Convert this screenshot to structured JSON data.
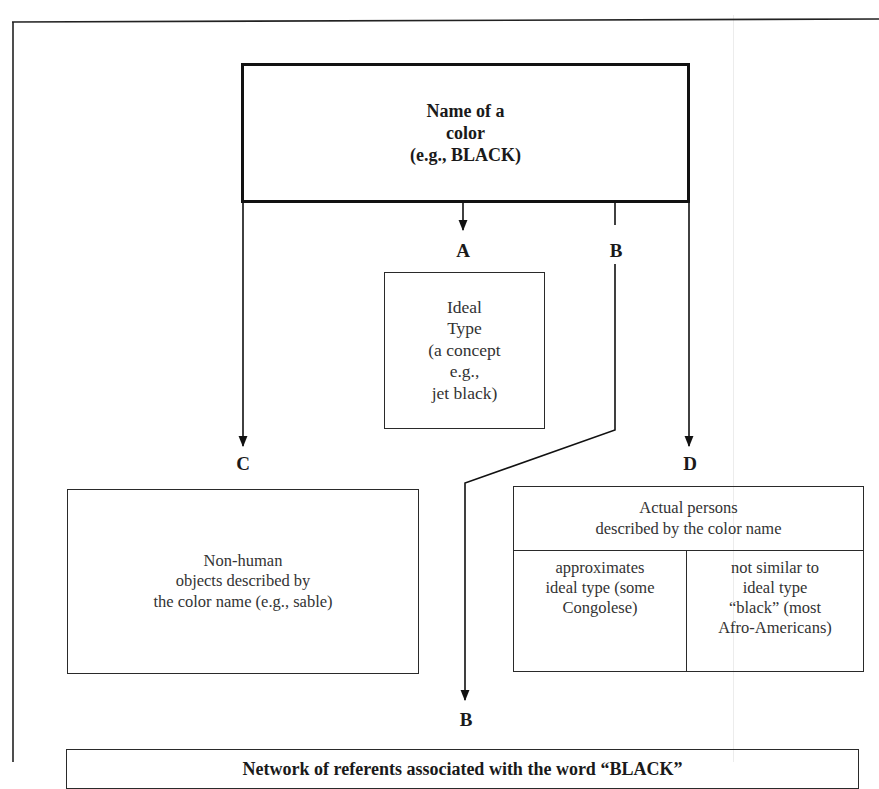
{
  "diagram": {
    "root": {
      "lines": [
        "Name of a",
        "color",
        "(e.g., BLACK)"
      ]
    },
    "branches": {
      "A": {
        "label": "A",
        "box_lines": [
          "Ideal",
          "Type",
          "(a concept",
          "e.g.,",
          "jet black)"
        ]
      },
      "B": {
        "label_top": "B",
        "label_bottom": "B"
      },
      "C": {
        "label": "C",
        "box_lines": [
          "Non-human",
          "objects described by",
          "the color name (e.g., sable)"
        ]
      },
      "D": {
        "label": "D",
        "header_lines": [
          "Actual persons",
          "described by the color name"
        ],
        "columns": [
          {
            "lines": [
              "approximates",
              "ideal type (some",
              "Congolese)"
            ]
          },
          {
            "lines": [
              "not similar to",
              "ideal type",
              "“black” (most",
              "Afro-Americans)"
            ]
          }
        ]
      }
    },
    "bottom_box": {
      "text": "Network of referents associated with the word “BLACK”"
    },
    "colors": {
      "line": "#1a1a1a",
      "background": "#ffffff"
    }
  }
}
